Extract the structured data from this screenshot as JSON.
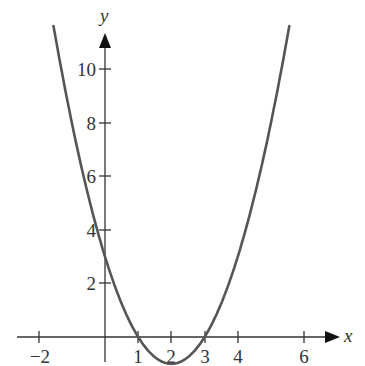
{
  "chart_data": {
    "type": "line",
    "title": "",
    "function": "y = x^2 - 4x + 3",
    "xlabel": "x",
    "ylabel": "y",
    "x_ticks": [
      -2,
      1,
      2,
      3,
      4,
      6
    ],
    "x_tick_labels": [
      "−2",
      "1",
      "2",
      "3",
      "4",
      "6"
    ],
    "y_ticks": [
      2,
      4,
      6,
      8,
      10
    ],
    "y_tick_labels": [
      "2",
      "4",
      "6",
      "8",
      "10"
    ],
    "xlim": [
      -2.3,
      7
    ],
    "ylim": [
      -1,
      11.5
    ],
    "grid": false,
    "legend": null,
    "series": [
      {
        "name": "parabola",
        "x": [
          -1.55,
          -1,
          0,
          1,
          2,
          3,
          4,
          5,
          5.55
        ],
        "y": [
          10.6,
          8,
          3,
          0,
          -1,
          0,
          3,
          8,
          10.6
        ]
      }
    ],
    "annotations": [
      "x-intercepts at 1 and 3",
      "vertex at (2, -1)",
      "y-intercept at 3"
    ],
    "colors": {
      "curve": "#555555",
      "axes": "#333333"
    }
  },
  "labels": {
    "x_axis": "x",
    "y_axis": "y",
    "xt0": "−2",
    "xt1": "1",
    "xt2": "2",
    "xt3": "3",
    "xt4": "4",
    "xt5": "6",
    "yt0": "2",
    "yt1": "4",
    "yt2": "6",
    "yt3": "8",
    "yt4": "10"
  }
}
